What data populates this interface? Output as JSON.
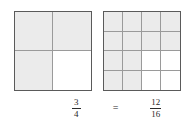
{
  "figure": {
    "background_color": "#ffffff",
    "shaded_color": "#ebebeb",
    "grid_line_color": "#9a9a9a",
    "border_color": "#5a5a5a",
    "text_color": "#2b2b2b"
  },
  "models": [
    {
      "name": "two-by-two-model",
      "columns": 2,
      "rows": 2,
      "total_parts": 4,
      "shaded_parts": 3,
      "shaded_cells": [
        true,
        true,
        true,
        false
      ]
    },
    {
      "name": "four-by-four-model",
      "columns": 4,
      "rows": 4,
      "total_parts": 16,
      "shaded_parts": 12,
      "shaded_cells": [
        true,
        true,
        true,
        true,
        true,
        true,
        true,
        true,
        true,
        true,
        false,
        false,
        true,
        true,
        false,
        false
      ]
    }
  ],
  "equation": {
    "left_fraction": {
      "numerator": "3",
      "denominator": "4"
    },
    "operator": "=",
    "right_fraction": {
      "numerator": "12",
      "denominator": "16"
    }
  },
  "chart_data": {
    "type": "area",
    "xlabel": "",
    "ylabel": "",
    "categories": [
      "3/4",
      "12/16"
    ],
    "values": [
      0.75,
      0.75
    ],
    "series": [
      {
        "name": "shaded parts",
        "values": [
          3,
          12
        ]
      },
      {
        "name": "total parts",
        "values": [
          4,
          16
        ]
      }
    ],
    "annotations": [
      "3/4",
      "=",
      "12/16"
    ],
    "grid": true,
    "legend": "none"
  }
}
